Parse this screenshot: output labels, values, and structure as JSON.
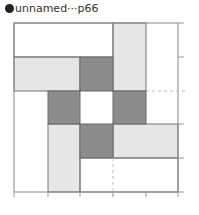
{
  "title": {
    "label": "unnamed···p66",
    "icon": "filled-circle-icon"
  },
  "diagram": {
    "type": "quilt-block-grid",
    "grid_size": 5,
    "colors": {
      "dark": "#8c8c8c",
      "light": "#e6e6e6",
      "white": "#ffffff",
      "line": "#777777"
    },
    "cells_dark": [
      [
        2,
        1
      ],
      [
        1,
        2
      ],
      [
        3,
        2
      ],
      [
        2,
        3
      ]
    ],
    "rects_light": [
      {
        "col": 0,
        "row": 1,
        "w": 2,
        "h": 1
      },
      {
        "col": 3,
        "row": 0,
        "w": 1,
        "h": 2
      },
      {
        "col": 1,
        "row": 3,
        "w": 1,
        "h": 2
      },
      {
        "col": 3,
        "row": 3,
        "w": 2,
        "h": 1
      }
    ]
  }
}
